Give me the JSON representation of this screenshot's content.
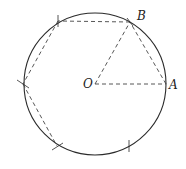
{
  "diagram": {
    "center": {
      "label": "O",
      "x": 95,
      "y": 84
    },
    "radius": 71,
    "points": {
      "A": {
        "label": "A",
        "x": 166,
        "y": 84
      },
      "B": {
        "label": "B",
        "x": 130,
        "y": 22
      }
    },
    "hexagon_vertices": [
      {
        "x": 130,
        "y": 22
      },
      {
        "x": 58,
        "y": 21
      },
      {
        "x": 23,
        "y": 84
      },
      {
        "x": 57,
        "y": 146
      }
    ],
    "tick_marks": [
      {
        "x": 58,
        "y": 21
      },
      {
        "x": 23,
        "y": 84
      },
      {
        "x": 57,
        "y": 146
      },
      {
        "x": 129,
        "y": 146
      }
    ],
    "colors": {
      "stroke": "#2a2a2a",
      "dash": "#444444"
    }
  }
}
